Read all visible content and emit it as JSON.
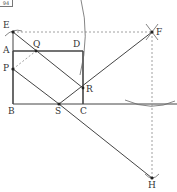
{
  "figure_tag": "94",
  "points": {
    "E": {
      "label": "E",
      "x": 13,
      "y": 32
    },
    "A": {
      "label": "A",
      "x": 13,
      "y": 51
    },
    "Q": {
      "label": "Q",
      "x": 36,
      "y": 51
    },
    "D": {
      "label": "D",
      "x": 83,
      "y": 51
    },
    "P": {
      "label": "P",
      "x": 13,
      "y": 69
    },
    "R": {
      "label": "R",
      "x": 83,
      "y": 88
    },
    "B": {
      "label": "B",
      "x": 13,
      "y": 104
    },
    "S": {
      "label": "S",
      "x": 59,
      "y": 104
    },
    "C": {
      "label": "C",
      "x": 83,
      "y": 104
    },
    "F": {
      "label": "F",
      "x": 152,
      "y": 32
    },
    "H": {
      "label": "H",
      "x": 152,
      "y": 178
    }
  },
  "colors": {
    "line": "#444444",
    "dashed": "#888888"
  }
}
